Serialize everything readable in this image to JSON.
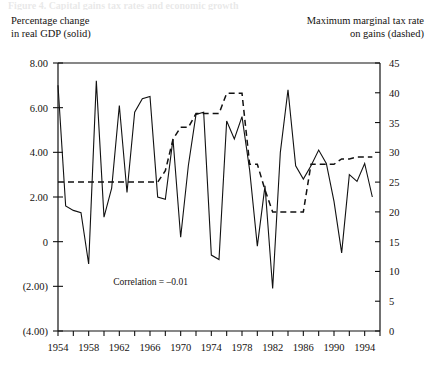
{
  "figure": {
    "top_caption_faint": "Figure 4. Capital gains tax rates and economic growth",
    "left_header": "Percentage change\nin real GDP (solid)",
    "right_header": "Maximum marginal tax rate\non gains (dashed)",
    "annotation": "Correlation = –0.01"
  },
  "chart_data": {
    "type": "line",
    "title": "",
    "xlabel": "",
    "ylabel": "Percentage change in real GDP (solid)",
    "y2label": "Maximum marginal tax rate on gains (dashed)",
    "grid": false,
    "legend": "none",
    "annotations": [
      "Correlation = –0.01"
    ],
    "xlim": [
      1954,
      1996
    ],
    "xticks_major": [
      1954,
      1958,
      1962,
      1966,
      1970,
      1974,
      1978,
      1982,
      1986,
      1990,
      1994
    ],
    "xticks_minor_step": 2,
    "xtick_labels": [
      "1954",
      "1958",
      "1962",
      "1966",
      "1970",
      "1974",
      "1978",
      "1982",
      "1986",
      "1990",
      "1994"
    ],
    "ylim": [
      -4,
      8
    ],
    "yticks": [
      -4,
      -2,
      0,
      2,
      4,
      6,
      8
    ],
    "ytick_labels": [
      "(4.00)",
      "(2.00)",
      "0",
      "2.00",
      "4.00",
      "6.00",
      "8.00"
    ],
    "y2lim": [
      0,
      45
    ],
    "y2ticks": [
      0,
      5,
      10,
      15,
      20,
      25,
      30,
      35,
      40,
      45
    ],
    "y2tick_labels": [
      "0",
      "5",
      "10",
      "15",
      "20",
      "25",
      "30",
      "35",
      "40",
      "45"
    ],
    "x": [
      1954,
      1955,
      1956,
      1957,
      1958,
      1959,
      1960,
      1961,
      1962,
      1963,
      1964,
      1965,
      1966,
      1967,
      1968,
      1969,
      1970,
      1971,
      1972,
      1973,
      1974,
      1975,
      1976,
      1977,
      1978,
      1979,
      1980,
      1981,
      1982,
      1983,
      1984,
      1985,
      1986,
      1987,
      1988,
      1989,
      1990,
      1991,
      1992,
      1993,
      1994,
      1995
    ],
    "series": [
      {
        "name": "Percentage change in real GDP",
        "style": "solid",
        "axis": "left",
        "color": "#111111",
        "values": [
          7.0,
          1.6,
          1.4,
          1.3,
          -1.0,
          7.2,
          1.1,
          2.4,
          6.1,
          2.2,
          5.8,
          6.4,
          6.5,
          2.0,
          1.9,
          4.6,
          0.2,
          3.4,
          5.7,
          5.8,
          -0.6,
          -0.8,
          5.4,
          4.6,
          5.6,
          3.2,
          -0.2,
          2.5,
          -2.1,
          4.0,
          6.8,
          3.4,
          2.8,
          3.4,
          4.1,
          3.5,
          1.8,
          -0.5,
          3.0,
          2.7,
          3.5,
          2.0
        ]
      },
      {
        "name": "Maximum marginal tax rate on gains",
        "style": "dashed",
        "axis": "right",
        "color": "#111111",
        "values": [
          25.0,
          25.0,
          25.0,
          25.0,
          25.0,
          25.0,
          25.0,
          25.0,
          25.0,
          25.0,
          25.0,
          25.0,
          25.0,
          25.0,
          26.9,
          32.2,
          34.2,
          34.2,
          36.5,
          36.5,
          36.5,
          36.5,
          39.9,
          39.9,
          39.9,
          28.0,
          28.0,
          23.7,
          20.0,
          20.0,
          20.0,
          20.0,
          20.0,
          28.0,
          28.0,
          28.0,
          28.0,
          28.9,
          28.9,
          29.2,
          29.2,
          29.2
        ]
      }
    ]
  }
}
